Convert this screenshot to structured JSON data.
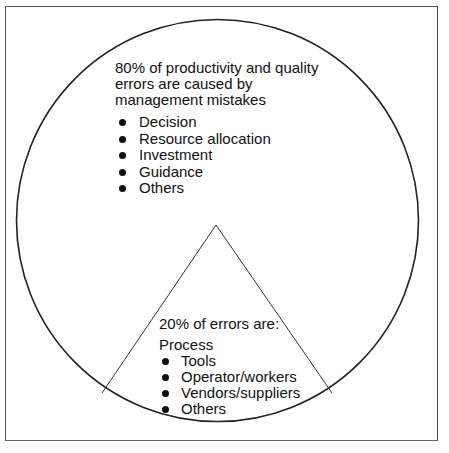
{
  "diagram": {
    "type": "pie-with-sector",
    "colors": {
      "stroke": "#222222",
      "background": "#ffffff",
      "text": "#111111"
    },
    "major_segment": {
      "share_percent": 80,
      "heading_lines": [
        "80% of productivity and quality",
        "errors are caused by",
        "management mistakes"
      ],
      "items": [
        "Decision",
        "Resource allocation",
        "Investment",
        "Guidance",
        "Others"
      ]
    },
    "minor_segment": {
      "share_percent": 20,
      "heading": "20% of errors are:",
      "subheading": "Process",
      "items": [
        "Tools",
        "Operator/workers",
        "Vendors/suppliers",
        "Others"
      ]
    }
  }
}
